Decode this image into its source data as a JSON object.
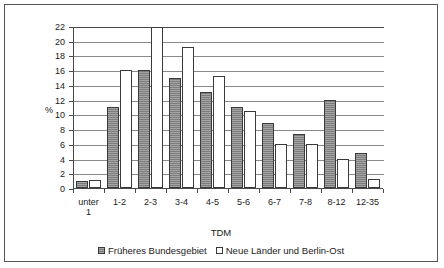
{
  "chart_data": {
    "type": "bar",
    "title": "",
    "xlabel": "TDM",
    "ylabel": "%",
    "ylim": [
      0,
      22
    ],
    "ytick_step": 2,
    "yticks": [
      0,
      2,
      4,
      6,
      8,
      10,
      12,
      14,
      16,
      18,
      20,
      22
    ],
    "grid": true,
    "legend_position": "bottom",
    "categories": [
      "unter 1",
      "1-2",
      "2-3",
      "3-4",
      "4-5",
      "5-6",
      "6-7",
      "7-8",
      "8-12",
      "12-35"
    ],
    "series": [
      {
        "name": "Früheres Bundesgebiet",
        "color": "#7d7d7d",
        "values": [
          0.9,
          11.0,
          16.0,
          15.0,
          13.0,
          11.0,
          8.8,
          7.3,
          12.0,
          4.8
        ]
      },
      {
        "name": "Neue Länder und Berlin-Ost",
        "color": "#ffffff",
        "values": [
          1.1,
          16.0,
          21.8,
          19.2,
          15.2,
          10.5,
          6.0,
          6.0,
          4.0,
          1.2
        ]
      }
    ]
  }
}
